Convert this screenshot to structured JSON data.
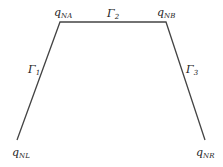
{
  "diagram": {
    "line_color": "#444444",
    "nodes": {
      "nl": {
        "base": "q",
        "sub": "NL"
      },
      "na": {
        "base": "q",
        "sub": "NA"
      },
      "nb": {
        "base": "q",
        "sub": "NB"
      },
      "nr": {
        "base": "q",
        "sub": "NR"
      }
    },
    "edges": {
      "g1": {
        "base": "Γ",
        "sub": "1"
      },
      "g2": {
        "base": "Γ",
        "sub": "2"
      },
      "g3": {
        "base": "Γ",
        "sub": "3"
      }
    }
  }
}
